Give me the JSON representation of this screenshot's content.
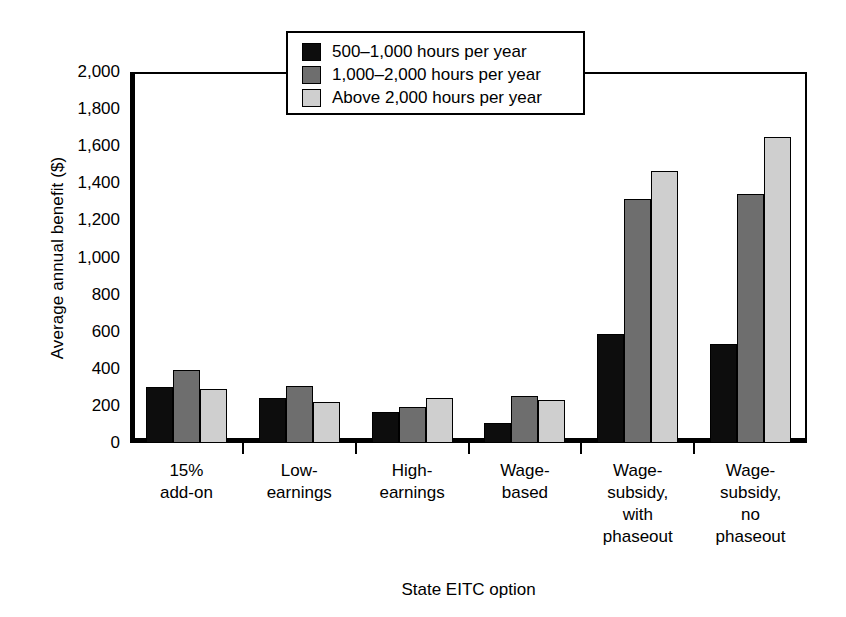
{
  "chart_data": {
    "type": "bar",
    "title": "",
    "xlabel": "State EITC option",
    "ylabel": "Average annual benefit ($)",
    "ylim": [
      0,
      2000
    ],
    "ytick_values": [
      0,
      200,
      400,
      600,
      800,
      1000,
      1200,
      1400,
      1600,
      1800,
      2000
    ],
    "ytick_labels": [
      "0",
      "200",
      "400",
      "600",
      "800",
      "1,000",
      "1,200",
      "1,400",
      "1,600",
      "1,800",
      "2,000"
    ],
    "grid": false,
    "legend_position": "upper center",
    "categories": [
      "15%\nadd-on",
      "Low-\nearnings",
      "High-\nearnings",
      "Wage-\nbased",
      "Wage-\nsubsidy,\nwith\nphaseout",
      "Wage-\nsubsidy,\nno\nphaseout"
    ],
    "series": [
      {
        "name": "500–1,000 hours per year",
        "color": "#0d0d0d",
        "values": [
          300,
          245,
          165,
          110,
          585,
          535
        ]
      },
      {
        "name": "1,000–2,000 hours per year",
        "color": "#6e6e6e",
        "values": [
          395,
          310,
          195,
          255,
          1315,
          1340
        ]
      },
      {
        "name": "Above 2,000 hours per year",
        "color": "#cfcfcf",
        "values": [
          290,
          220,
          240,
          232,
          1465,
          1650
        ]
      }
    ]
  }
}
